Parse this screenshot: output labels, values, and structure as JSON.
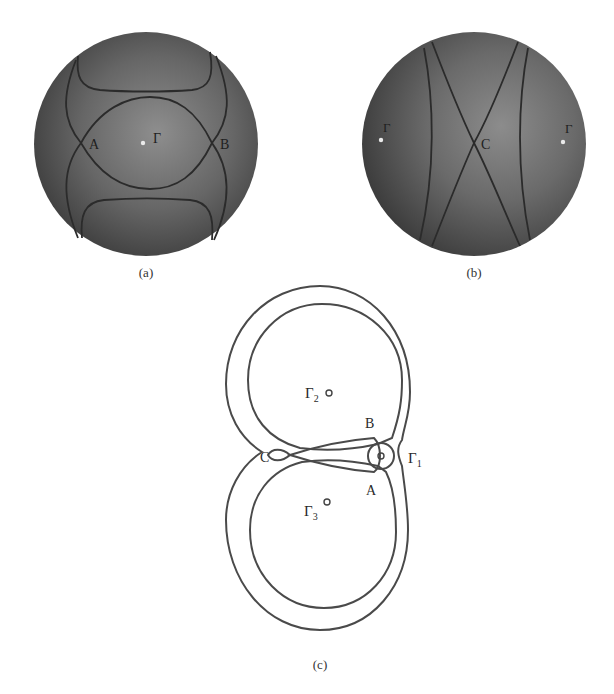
{
  "figure": {
    "panel_a": {
      "caption": "(a)",
      "points": {
        "A": "A",
        "B": "B"
      },
      "center_label": "Γ",
      "center_label_sub": "",
      "description": "Fermi surface cross-section on a shaded sphere centered at Γ, with contact points A and B"
    },
    "panel_b": {
      "caption": "(b)",
      "points": {
        "C": "C"
      },
      "left_label": "Γ",
      "right_label": "Γ",
      "description": "Shaded sphere with crossing curves meeting at point C, Γ points at left and right edges"
    },
    "panel_c": {
      "caption": "(c)",
      "points": {
        "A": "A",
        "B": "B",
        "C": "C"
      },
      "gamma1": {
        "base": "Γ",
        "sub": "1"
      },
      "gamma2": {
        "base": "Γ",
        "sub": "2"
      },
      "gamma3": {
        "base": "Γ",
        "sub": "3"
      },
      "description": "Line-drawing of nested orbits around Γ2 and Γ3 with a small orbit at Γ1, crossing at C"
    }
  },
  "colors": {
    "sphere_dark": "#3c3c3c",
    "sphere_light": "#8a8a8a",
    "line": "#2b2b2b",
    "background": "#ffffff"
  }
}
